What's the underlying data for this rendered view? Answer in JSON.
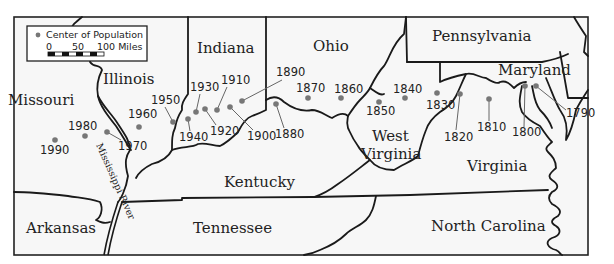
{
  "legend": {
    "symbol_label": "Center of Population",
    "scale_ticks": [
      "0",
      "50",
      "100 Miles"
    ]
  },
  "states": [
    {
      "name": "Missouri",
      "x": 8,
      "y": 105
    },
    {
      "name": "Illinois",
      "x": 103,
      "y": 84
    },
    {
      "name": "Indiana",
      "x": 197,
      "y": 53
    },
    {
      "name": "Ohio",
      "x": 313,
      "y": 51
    },
    {
      "name": "Pennsylvania",
      "x": 432,
      "y": 41
    },
    {
      "name": "Maryland",
      "x": 498,
      "y": 75
    },
    {
      "name": "West",
      "x": 372,
      "y": 141
    },
    {
      "name": "Virginia",
      "x": 361,
      "y": 159
    },
    {
      "name": "Virginia",
      "x": 467,
      "y": 171
    },
    {
      "name": "Kentucky",
      "x": 224,
      "y": 187
    },
    {
      "name": "Arkansas",
      "x": 26,
      "y": 233
    },
    {
      "name": "Tennessee",
      "x": 193,
      "y": 233
    },
    {
      "name": "North Carolina",
      "x": 431,
      "y": 231
    }
  ],
  "river": {
    "name": "Mississippi River"
  },
  "population_centers": [
    {
      "year": "1790",
      "dot": [
        536,
        86
      ],
      "label": [
        566,
        117
      ]
    },
    {
      "year": "1800",
      "dot": [
        525,
        86
      ],
      "label": [
        512,
        136
      ]
    },
    {
      "year": "1810",
      "dot": [
        489,
        99
      ],
      "label": [
        477,
        131
      ]
    },
    {
      "year": "1820",
      "dot": [
        460,
        94
      ],
      "label": [
        448,
        141
      ]
    },
    {
      "year": "1830",
      "dot": [
        437,
        93
      ],
      "label": [
        426,
        109
      ]
    },
    {
      "year": "1840",
      "dot": [
        405,
        98
      ],
      "label": [
        393,
        93
      ]
    },
    {
      "year": "1850",
      "dot": [
        379,
        102
      ],
      "label": [
        366,
        115
      ]
    },
    {
      "year": "1860",
      "dot": [
        341,
        98
      ],
      "label": [
        334,
        93
      ]
    },
    {
      "year": "1870",
      "dot": [
        308,
        98
      ],
      "label": [
        296,
        92
      ]
    },
    {
      "year": "1880",
      "dot": [
        276,
        104
      ],
      "label": [
        265,
        138
      ]
    },
    {
      "year": "1890",
      "dot": [
        242,
        101
      ],
      "label": [
        270,
        76
      ]
    },
    {
      "year": "1900",
      "dot": [
        230,
        107
      ],
      "label": [
        247,
        140
      ]
    },
    {
      "year": "1910",
      "dot": [
        217,
        110
      ],
      "label": [
        221,
        84
      ]
    },
    {
      "year": "1920",
      "dot": [
        205,
        109
      ],
      "label": [
        210,
        135
      ]
    },
    {
      "year": "1930",
      "dot": [
        196,
        112
      ],
      "label": [
        190,
        91
      ]
    },
    {
      "year": "1940",
      "dot": [
        188,
        119
      ],
      "label": [
        179,
        141
      ]
    },
    {
      "year": "1950",
      "dot": [
        173,
        122
      ],
      "label": [
        151,
        104
      ]
    },
    {
      "year": "1960",
      "dot": [
        139,
        127
      ],
      "label": [
        128,
        118
      ]
    },
    {
      "year": "1970",
      "dot": [
        107,
        132
      ],
      "label": [
        118,
        150
      ]
    },
    {
      "year": "1980",
      "dot": [
        85,
        136
      ],
      "label": [
        68,
        130
      ]
    },
    {
      "year": "1990",
      "dot": [
        55,
        140
      ],
      "label": [
        40,
        154
      ]
    }
  ]
}
